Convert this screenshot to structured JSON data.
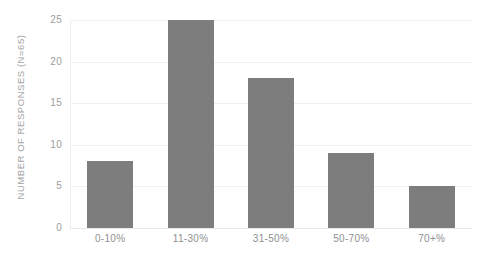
{
  "chart_data": {
    "type": "bar",
    "title": "",
    "xlabel": "",
    "ylabel": "NUMBER OF RESPONSES (N=65)",
    "categories": [
      "0-10%",
      "11-30%",
      "31-50%",
      "50-70%",
      "70+%"
    ],
    "values": [
      8,
      25,
      18,
      9,
      5
    ],
    "ylim": [
      0,
      25
    ],
    "yticks": [
      0,
      5,
      10,
      15,
      20,
      25
    ],
    "ytick_labels": [
      "0",
      "5",
      "10",
      "15",
      "20",
      "25"
    ],
    "grid": true,
    "legend": false,
    "legend_position": "none",
    "bar_color": "#7d7d7d",
    "gridline_color": "#f0f0f0",
    "tick_label_color": "#9d9d9d",
    "axis_title_color": "#a5a5a5",
    "background_color": "#ffffff"
  },
  "caption": {
    "cropped_text": ""
  }
}
